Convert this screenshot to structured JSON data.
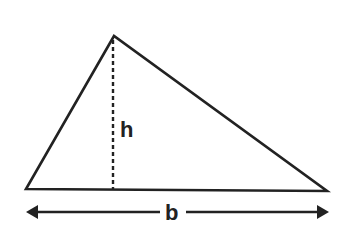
{
  "diagram": {
    "colors": {
      "stroke": "#222222",
      "background": "#ffffff"
    },
    "vertices": {
      "apex": [
        114,
        36
      ],
      "bottom_left": [
        26,
        189
      ],
      "bottom_right": [
        327,
        191
      ]
    },
    "height_line": {
      "x": 113,
      "y1": 40,
      "y2": 189,
      "style": "dashed"
    },
    "labels": {
      "height": "h",
      "base": "b"
    },
    "base_arrow": {
      "y": 212,
      "x1": 26,
      "x2": 328,
      "double_headed": true
    }
  }
}
